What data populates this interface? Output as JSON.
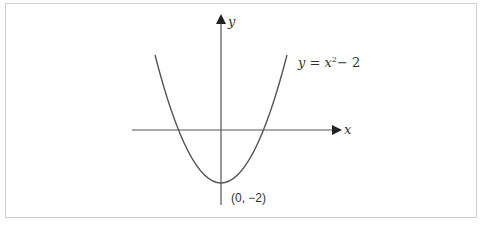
{
  "diagram": {
    "axes": {
      "x_label": "x",
      "y_label": "y"
    },
    "curve": {
      "equation_prefix": "y = x",
      "equation_exponent": "2",
      "equation_suffix": "− 2",
      "equation_full": "y = x² − 2",
      "stroke_color": "#555555"
    },
    "vertex": {
      "label": "(0, −2)",
      "x": 0,
      "y": -2
    },
    "colors": {
      "axis": "#555555",
      "text": "#333333",
      "frame": "#cfcfcf"
    }
  }
}
